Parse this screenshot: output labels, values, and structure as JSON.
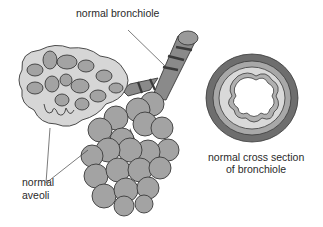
{
  "labels": {
    "bronchiole": "normal bronchiole",
    "alveoli_line1": "normal",
    "alveoli_line2": "aveoli",
    "cross_section_line1": "normal cross section",
    "cross_section_line2": "of bronchiole"
  },
  "colors": {
    "background": "#ffffff",
    "outline": "#3a3a3a",
    "light_fill": "#d6d6d6",
    "medium_fill": "#a3a3a3",
    "dark_fill": "#5c5c5c",
    "ring_outer": "#6e6e6e",
    "ring_middle": "#a8a8a8",
    "ring_inner": "#d9d9d9"
  }
}
